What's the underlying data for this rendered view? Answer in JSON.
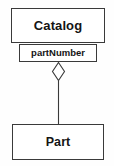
{
  "diagram": {
    "type": "uml-class-diagram",
    "relationship": "aggregation",
    "canvas": {
      "width": 114,
      "height": 166,
      "background": "#fefefe"
    },
    "colors": {
      "line": "#3a3a3a",
      "text": "#141414",
      "fill": "#ffffff"
    },
    "classes": [
      {
        "id": "catalog",
        "name": "Catalog",
        "role": "whole",
        "x": 11,
        "y": 8,
        "width": 94,
        "height": 35
      },
      {
        "id": "part",
        "name": "Part",
        "role": "part",
        "x": 12,
        "y": 124,
        "width": 92,
        "height": 36
      }
    ],
    "association": {
      "rolename": "partNumber",
      "rolename_box": {
        "x": 19,
        "y": 44,
        "width": 78,
        "height": 18
      },
      "adornment": "hollow-diamond",
      "adornment_end": "catalog",
      "diamond": {
        "cx": 58.5,
        "cy": 71.5,
        "rx": 6,
        "ry": 9
      },
      "connector": {
        "x": 58.5,
        "y1": 80.5,
        "y2": 124
      }
    }
  }
}
